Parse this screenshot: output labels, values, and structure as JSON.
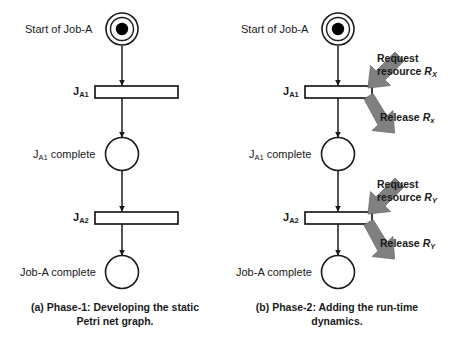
{
  "figure": {
    "colors": {
      "stroke": "#1a1a1a",
      "token": "#000000",
      "block_arrow": "#808080",
      "block_arrow_dark": "#6b6b6b",
      "background": "#ffffff"
    }
  },
  "panels": [
    {
      "id": "panel-a",
      "caption_line1": "(a) Phase-1: Developing the static",
      "caption_line2": "Petri net graph.",
      "places": [
        {
          "id": "start",
          "label": "Start of Job-A",
          "label_sub": "",
          "token": true,
          "double": true
        },
        {
          "id": "ja1-complete",
          "label": "J",
          "label_sub": "A1",
          "label_tail": " complete",
          "token": false,
          "double": false
        },
        {
          "id": "joba-complete",
          "label": "Job-A complete",
          "label_sub": "",
          "token": false,
          "double": false
        }
      ],
      "transitions": [
        {
          "id": "ja1",
          "label": "J",
          "label_sub": "A1"
        },
        {
          "id": "ja2",
          "label": "J",
          "label_sub": "A2"
        }
      ],
      "annotations": []
    },
    {
      "id": "panel-b",
      "caption_line1": "(b) Phase-2: Adding the run-time",
      "caption_line2": "dynamics.",
      "places": [
        {
          "id": "start",
          "label": "Start of Job-A",
          "label_sub": "",
          "token": true,
          "double": true
        },
        {
          "id": "ja1-complete",
          "label": "J",
          "label_sub": "A1",
          "label_tail": " complete",
          "token": false,
          "double": false
        },
        {
          "id": "joba-complete",
          "label": "Job-A complete",
          "label_sub": "",
          "token": false,
          "double": false
        }
      ],
      "transitions": [
        {
          "id": "ja1",
          "label": "J",
          "label_sub": "A1"
        },
        {
          "id": "ja2",
          "label": "J",
          "label_sub": "A2"
        }
      ],
      "annotations": [
        {
          "id": "request-rx",
          "line1": "Request",
          "line2": "resource ",
          "resource": "R",
          "resource_sub": "X",
          "direction": "down-left"
        },
        {
          "id": "release-rx",
          "line1": "Release ",
          "line2": "",
          "resource": "R",
          "resource_sub": "x",
          "direction": "down-right"
        },
        {
          "id": "request-ry",
          "line1": "Request",
          "line2": "resource ",
          "resource": "R",
          "resource_sub": "Y",
          "direction": "down-left"
        },
        {
          "id": "release-ry",
          "line1": "Release ",
          "line2": "",
          "resource": "R",
          "resource_sub": "Y",
          "direction": "down-right"
        }
      ]
    }
  ]
}
